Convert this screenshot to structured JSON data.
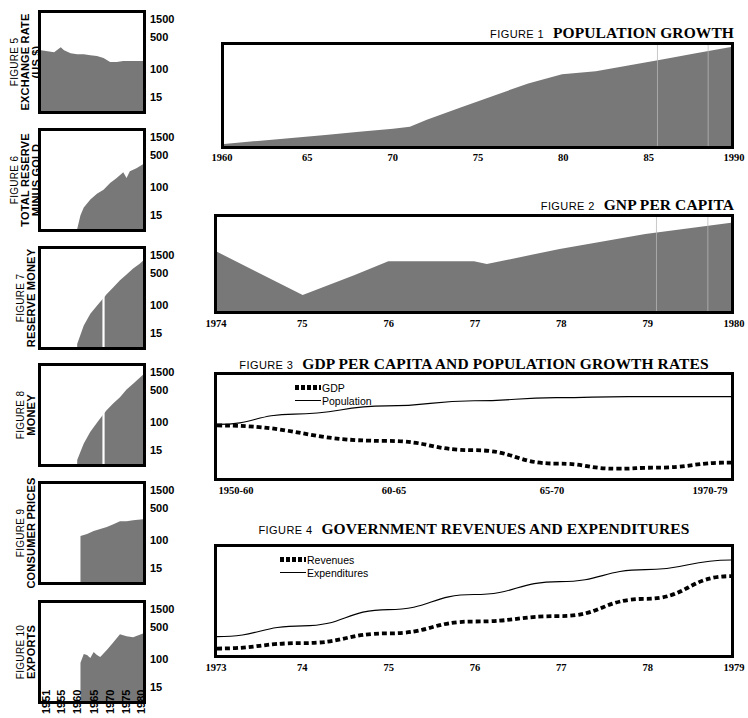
{
  "left_column": {
    "y_ticks": [
      "1500",
      "500",
      "100",
      "15"
    ],
    "x_years": [
      "1951",
      "1955",
      "1960",
      "1965",
      "1970",
      "1975",
      "1980"
    ],
    "figures": [
      {
        "number": "FIGURE 5",
        "title": "EXCHANGE RATE",
        "subtitle": "(US $)"
      },
      {
        "number": "FIGURE 6",
        "title": "TOTAL RESERVE",
        "subtitle": "MINUS GOLD"
      },
      {
        "number": "FIGURE 7",
        "title": "RESERVE MONEY",
        "subtitle": ""
      },
      {
        "number": "FIGURE 8",
        "title": "MONEY",
        "subtitle": ""
      },
      {
        "number": "FIGURE 9",
        "title": "CONSUMER PRICES",
        "subtitle": ""
      },
      {
        "number": "FIGURE 10",
        "title": "EXPORTS",
        "subtitle": ""
      }
    ]
  },
  "right_column": {
    "figures": [
      {
        "number": "FIGURE 1",
        "title": "POPULATION GROWTH"
      },
      {
        "number": "FIGURE 2",
        "title": "GNP PER CAPITA"
      },
      {
        "number": "FIGURE 3",
        "title": "GDP PER CAPITA AND POPULATION GROWTH RATES"
      },
      {
        "number": "FIGURE 4",
        "title": "GOVERNMENT REVENUES AND EXPENDITURES"
      }
    ]
  },
  "colors": {
    "fill_gray": "#787878",
    "ink": "#000000",
    "paper": "#ffffff"
  },
  "chart_data": [
    {
      "id": "fig1",
      "type": "area",
      "title": "POPULATION GROWTH",
      "figure_label": "FIGURE 1",
      "xlabel": "",
      "ylabel": "",
      "grid": false,
      "legend": null,
      "tick_labels": [
        "1960",
        "65",
        "70",
        "75",
        "80",
        "85",
        "1990"
      ],
      "x": [
        1960,
        1962,
        1964,
        1966,
        1968,
        1970,
        1971,
        1972,
        1974,
        1976,
        1978,
        1980,
        1982,
        1984,
        1986,
        1988,
        1990
      ],
      "values": [
        2,
        5,
        8,
        11,
        14,
        17,
        19,
        26,
        38,
        50,
        62,
        71,
        74,
        80,
        86,
        92,
        98
      ],
      "ylim": [
        0,
        100
      ]
    },
    {
      "id": "fig2",
      "type": "area",
      "title": "GNP PER CAPITA",
      "figure_label": "FIGURE 2",
      "xlabel": "",
      "ylabel": "",
      "grid": false,
      "legend": null,
      "tick_labels": [
        "1974",
        "75",
        "76",
        "77",
        "78",
        "79",
        "1980"
      ],
      "x": [
        1974,
        1975,
        1975.6,
        1976,
        1977,
        1977.15,
        1978,
        1979,
        1980
      ],
      "values": [
        63,
        17,
        38,
        53,
        53,
        50,
        66,
        82,
        94
      ],
      "ylim": [
        0,
        100
      ]
    },
    {
      "id": "fig3",
      "type": "line",
      "title": "GDP PER CAPITA AND POPULATION GROWTH RATES",
      "figure_label": "FIGURE 3",
      "xlabel": "",
      "ylabel": "",
      "grid": false,
      "legend": {
        "position": "top-left",
        "entries": [
          "GDP",
          "Population"
        ]
      },
      "categories": [
        "1950-60",
        "60-65",
        "65-70",
        "1970-79"
      ],
      "tick_labels": [
        "1950-60",
        "60-65",
        "65-70",
        "1970-79"
      ],
      "series": [
        {
          "name": "GDP",
          "style": "dashed",
          "x": [
            0,
            0.33,
            0.5,
            0.66,
            0.78,
            0.85,
            1.0
          ],
          "values": [
            51,
            36,
            27,
            14,
            9,
            10,
            15
          ]
        },
        {
          "name": "Population",
          "style": "solid",
          "x": [
            0,
            0.15,
            0.33,
            0.5,
            0.66,
            0.8,
            1.0
          ],
          "values": [
            52,
            62,
            70,
            75,
            78,
            79,
            79
          ]
        }
      ],
      "ylim": [
        0,
        100
      ]
    },
    {
      "id": "fig4",
      "type": "line",
      "title": "GOVERNMENT REVENUES AND EXPENDITURES",
      "figure_label": "FIGURE 4",
      "xlabel": "",
      "ylabel": "",
      "grid": false,
      "legend": {
        "position": "top-left",
        "entries": [
          "Revenues",
          "Expenditures"
        ]
      },
      "tick_labels": [
        "1973",
        "74",
        "75",
        "76",
        "77",
        "78",
        "1979"
      ],
      "series": [
        {
          "name": "Revenues",
          "style": "dashed",
          "x": [
            1973,
            1974,
            1975,
            1976,
            1977,
            1978,
            1979
          ],
          "values": [
            6,
            11,
            20,
            31,
            36,
            52,
            73
          ]
        },
        {
          "name": "Expenditures",
          "style": "solid",
          "x": [
            1973,
            1974,
            1975,
            1976,
            1977,
            1978,
            1979
          ],
          "values": [
            17,
            27,
            42,
            56,
            68,
            79,
            88
          ]
        }
      ],
      "ylim": [
        0,
        100
      ]
    },
    {
      "id": "fig5",
      "type": "area",
      "title": "EXCHANGE RATE",
      "figure_label": "FIGURE 5",
      "yscale": "log",
      "y_tick_labels": [
        "1500",
        "500",
        "100",
        "15"
      ],
      "x_tick_labels": [
        "1951",
        "1955",
        "1960",
        "1965",
        "1970",
        "1975",
        "1980"
      ],
      "x": [
        1951,
        1953,
        1955,
        1957,
        1958,
        1960,
        1962,
        1964,
        1966,
        1968,
        1970,
        1972,
        1974,
        1976,
        1978,
        1980,
        1982
      ],
      "values": [
        62,
        61,
        60,
        65,
        62,
        59,
        58,
        58,
        57,
        56,
        54,
        50,
        50,
        51,
        51,
        51,
        51
      ],
      "ylim": [
        0,
        100
      ]
    },
    {
      "id": "fig6",
      "type": "area",
      "title": "TOTAL RESERVE MINUS GOLD",
      "figure_label": "FIGURE 6",
      "yscale": "log",
      "y_tick_labels": [
        "1500",
        "500",
        "100",
        "15"
      ],
      "x_tick_labels": [
        "1951",
        "1955",
        "1960",
        "1965",
        "1970",
        "1975",
        "1980"
      ],
      "x": [
        1962,
        1963,
        1964,
        1966,
        1968,
        1970,
        1972,
        1974,
        1976,
        1977,
        1978,
        1980,
        1982
      ],
      "values": [
        0,
        14,
        22,
        30,
        36,
        40,
        47,
        52,
        58,
        52,
        59,
        62,
        66
      ],
      "ylim": [
        0,
        100
      ]
    },
    {
      "id": "fig7",
      "type": "area",
      "title": "RESERVE MONEY",
      "figure_label": "FIGURE 7",
      "yscale": "log",
      "y_tick_labels": [
        "1500",
        "500",
        "100",
        "15"
      ],
      "x_tick_labels": [
        "1951",
        "1955",
        "1960",
        "1965",
        "1970",
        "1975",
        "1980"
      ],
      "x": [
        1962,
        1964,
        1966,
        1968,
        1970,
        1971,
        1973,
        1975,
        1977,
        1979,
        1981,
        1982
      ],
      "values": [
        3,
        22,
        34,
        42,
        50,
        54,
        61,
        68,
        74,
        80,
        85,
        88
      ],
      "break_at": 1970,
      "ylim": [
        0,
        100
      ]
    },
    {
      "id": "fig8",
      "type": "area",
      "title": "MONEY",
      "figure_label": "FIGURE 8",
      "yscale": "log",
      "y_tick_labels": [
        "1500",
        "500",
        "100",
        "15"
      ],
      "x_tick_labels": [
        "1951",
        "1955",
        "1960",
        "1965",
        "1970",
        "1975",
        "1980"
      ],
      "x": [
        1962,
        1964,
        1966,
        1968,
        1970,
        1971,
        1973,
        1975,
        1977,
        1979,
        1981,
        1982
      ],
      "values": [
        4,
        21,
        33,
        42,
        51,
        55,
        62,
        68,
        76,
        82,
        88,
        91
      ],
      "break_at": 1970,
      "ylim": [
        0,
        100
      ]
    },
    {
      "id": "fig9",
      "type": "area",
      "title": "CONSUMER PRICES",
      "figure_label": "FIGURE 9",
      "yscale": "log",
      "y_tick_labels": [
        "1500",
        "500",
        "100",
        "15"
      ],
      "x_tick_labels": [
        "1951",
        "1955",
        "1960",
        "1965",
        "1970",
        "1975",
        "1980"
      ],
      "x": [
        1963,
        1965,
        1967,
        1969,
        1971,
        1973,
        1975,
        1977,
        1979,
        1982
      ],
      "values": [
        47,
        49,
        52,
        54,
        56,
        59,
        62,
        62,
        63,
        64
      ],
      "ylim": [
        0,
        100
      ]
    },
    {
      "id": "fig10",
      "type": "area",
      "title": "EXPORTS",
      "figure_label": "FIGURE 10",
      "yscale": "log",
      "y_tick_labels": [
        "1500",
        "500",
        "100",
        "15"
      ],
      "x_tick_labels": [
        "1951",
        "1955",
        "1960",
        "1965",
        "1970",
        "1975",
        "1980"
      ],
      "x": [
        1963,
        1964,
        1965,
        1966,
        1967,
        1968,
        1969,
        1971,
        1973,
        1975,
        1977,
        1979,
        1982
      ],
      "values": [
        39,
        48,
        47,
        44,
        50,
        47,
        45,
        52,
        60,
        68,
        66,
        65,
        69
      ],
      "ylim": [
        0,
        100
      ]
    }
  ]
}
